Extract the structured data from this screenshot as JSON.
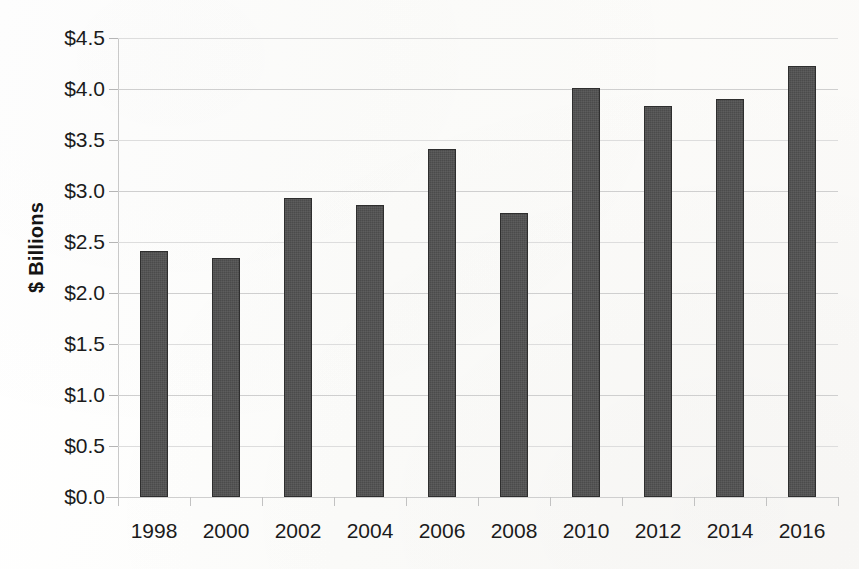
{
  "chart_data": {
    "type": "bar",
    "title": "",
    "xlabel": "",
    "ylabel": "$ Billions",
    "categories": [
      "1998",
      "2000",
      "2002",
      "2004",
      "2006",
      "2008",
      "2010",
      "2012",
      "2014",
      "2016"
    ],
    "values": [
      2.41,
      2.34,
      2.93,
      2.86,
      3.41,
      2.78,
      4.01,
      3.83,
      3.9,
      4.23
    ],
    "ylim": [
      0.0,
      4.5
    ],
    "ytick_values": [
      0.0,
      0.5,
      1.0,
      1.5,
      2.0,
      2.5,
      3.0,
      3.5,
      4.0,
      4.5
    ],
    "ytick_labels": [
      "$0.0",
      "$0.5",
      "$1.0",
      "$1.5",
      "$2.0",
      "$2.5",
      "$3.0",
      "$3.5",
      "$4.0",
      "$4.5"
    ],
    "grid": true,
    "grid_axis": "y",
    "legend": false,
    "bar_color": "#4b4b4b",
    "bar_edge_color": "#2e2e2e",
    "gridline_color": "#cfcfcf",
    "background_color": "#fdfdfc",
    "text_color": "#1b1b1b"
  }
}
